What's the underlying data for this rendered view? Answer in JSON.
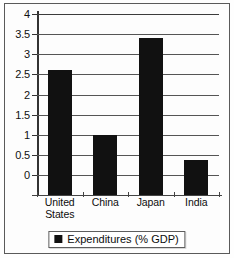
{
  "chart_data": {
    "type": "bar",
    "title": "",
    "subtitle": "",
    "xlabel": "",
    "ylabel": "",
    "categories": [
      "United States",
      "China",
      "Japan",
      "India"
    ],
    "category_lines": [
      [
        "United",
        "States"
      ],
      [
        "China"
      ],
      [
        "Japan"
      ],
      [
        "India"
      ]
    ],
    "values": [
      2.6,
      1.0,
      3.4,
      0.37
    ],
    "series": [
      {
        "name": "Expenditures (% GDP)",
        "values": [
          2.6,
          1.0,
          3.4,
          0.37
        ],
        "color": "#111111"
      }
    ],
    "ylim": [
      0,
      4
    ],
    "ytick_step": 0.5,
    "yticks": [
      0,
      0.5,
      1,
      1.5,
      2,
      2.5,
      3,
      3.5,
      4
    ],
    "ytick_labels": [
      "0",
      "0.5",
      "1",
      "1.5",
      "2",
      "2.5",
      "3",
      "3.5",
      "4"
    ],
    "grid": true,
    "grid_axis": "y",
    "legend": {
      "position": "bottom",
      "bordered": true,
      "entries": [
        {
          "label": "Expenditures (% GDP)",
          "marker": "square",
          "color": "#111111"
        }
      ]
    },
    "bar_color": "#111111",
    "background_color": "#ffffff",
    "frame": true
  },
  "legend": {
    "label": "Expenditures (% GDP)"
  }
}
